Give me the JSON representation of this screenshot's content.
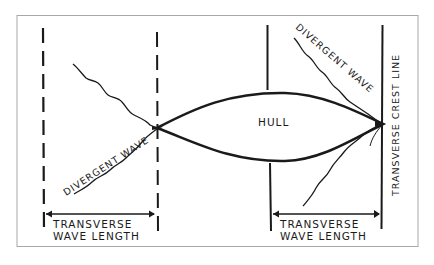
{
  "diagram": {
    "type": "ship-wave-pattern",
    "labels": {
      "hull": "HULL",
      "divergent_wave_left": "DIVERGENT WAVE",
      "divergent_wave_right": "DIVERGENT WAVE",
      "crest_line": "TRANSVERSE CREST LINE",
      "wavelength_left_line1": "TRANSVERSE",
      "wavelength_left_line2": "WAVE LENGTH",
      "wavelength_right_line1": "TRANSVERSE",
      "wavelength_right_line2": "WAVE LENGTH"
    },
    "colors": {
      "ink": "#1a1a1a",
      "frame": "#9a9a9a",
      "background": "#ffffff"
    }
  }
}
